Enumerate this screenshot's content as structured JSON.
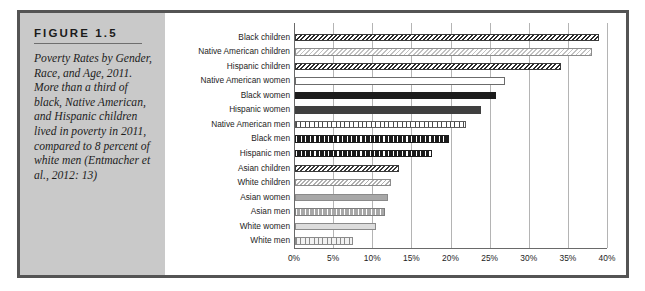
{
  "figure": {
    "number_label": "FIGURE 1.5",
    "caption": "Poverty Rates by Gender, Race, and Age, 2011. More than a third of black, Native American, and Hispanic children lived in poverty in 2011, compared to 8 percent of white men (Entmacher et al., 2012: 13)"
  },
  "colors": {
    "frame": "#545454",
    "caption_panel": "#c9c9c9",
    "gridline": "#b4b4b4",
    "axis": "#6a6a6a",
    "text": "#1d1d1d"
  },
  "chart_data": {
    "type": "bar",
    "orientation": "horizontal",
    "title": "",
    "subtitle": "",
    "xlabel": "",
    "ylabel": "",
    "xlim": [
      0,
      40
    ],
    "grid": true,
    "legend": "none",
    "tick_labels": [
      "0%",
      "5%",
      "10%",
      "15%",
      "20%",
      "25%",
      "30%",
      "35%",
      "40%"
    ],
    "tick_values": [
      0,
      5,
      10,
      15,
      20,
      25,
      30,
      35,
      40
    ],
    "categories": [
      "Black children",
      "Native American children",
      "Hispanic children",
      "Native American women",
      "Black women",
      "Hispanic women",
      "Native American men",
      "Black men",
      "Hispanic men",
      "Asian children",
      "White children",
      "Asian women",
      "Asian men",
      "White women",
      "White men"
    ],
    "values": [
      38.8,
      38.0,
      34.0,
      26.9,
      25.7,
      23.8,
      21.8,
      19.7,
      17.5,
      13.3,
      12.3,
      11.9,
      11.5,
      10.4,
      7.4
    ],
    "patterns": [
      "p-dark-diag",
      "p-light-diag",
      "p-dark-diag",
      "p-white",
      "p-solid-black",
      "p-solid-dark",
      "p-white-dots",
      "p-black-dots",
      "p-black-dots",
      "p-dark-diag2",
      "p-midlight-diag",
      "p-solid-gray",
      "p-gray-dots",
      "p-light-gray",
      "p-lightgray-dots"
    ]
  }
}
